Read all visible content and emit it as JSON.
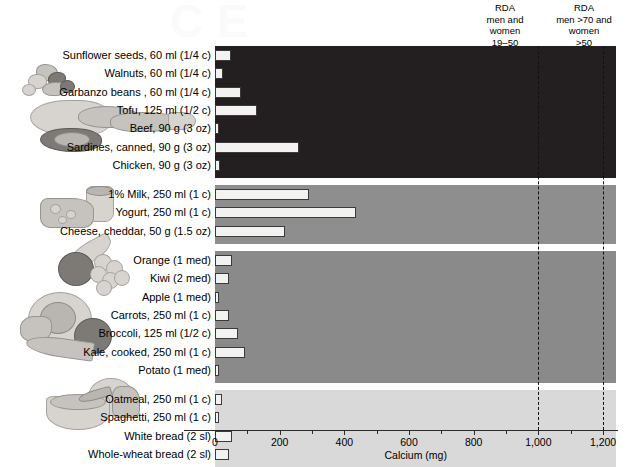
{
  "watermark_text": "CE",
  "axis": {
    "x_title": "Calcium (mg)",
    "ticks": [
      0,
      200,
      400,
      600,
      800,
      1000,
      1200
    ],
    "tick_labels": [
      "0",
      "200",
      "400",
      "600",
      "800",
      "1,000",
      "1,200"
    ],
    "xmin": 0,
    "xmax": 1240
  },
  "rda_lines": [
    {
      "name": "rda-19-50",
      "value": 1000,
      "label": "RDA\nmen and\nwomen\n19–50"
    },
    {
      "name": "rda-over-70",
      "value": 1200,
      "label": "RDA\nmen >70 and\nwomen\n>50"
    }
  ],
  "colors": {
    "band_protein": "#231f20",
    "band_dairy": "#8e8e8e",
    "band_produce": "#8a8a8a",
    "band_grains": "#d9d9d9",
    "bar_fill": "#f2f2f0",
    "bar_stroke": "#3a3a3a",
    "axis": "#2b2b2b"
  },
  "chart_data": {
    "type": "bar",
    "orientation": "horizontal",
    "title": "",
    "xlabel": "Calcium (mg)",
    "ylabel": "",
    "xlim": [
      0,
      1240
    ],
    "grid": false,
    "legend": "none",
    "annotations": [
      {
        "type": "vline",
        "value": 1000,
        "label": "RDA men and women 19–50"
      },
      {
        "type": "vline",
        "value": 1200,
        "label": "RDA men >70 and women >50"
      }
    ],
    "groups": [
      {
        "name": "protein-foods",
        "background": "#231f20",
        "illustration": "meat-fish-nuts-illustration",
        "categories": [
          "Sunflower seeds, 60 ml (1/4 c)",
          "Walnuts, 60 ml (1/4 c)",
          "Garbanzo beans , 60 ml (1/4 c)",
          "Tofu, 125 ml (1/2 c)",
          "Beef, 90 g (3 oz)",
          "Sardines, canned, 90 g (3 oz)",
          "Chicken, 90 g (3 oz)"
        ],
        "values": [
          50,
          25,
          80,
          130,
          10,
          260,
          15
        ]
      },
      {
        "name": "dairy-foods",
        "background": "#8e8e8e",
        "illustration": "cheese-milk-illustration",
        "categories": [
          "1% Milk, 250 ml (1 c)",
          "Yogurt, 250 ml (1 c)",
          "Cheese, cheddar, 50 g (1.5 oz)"
        ],
        "values": [
          290,
          435,
          215
        ]
      },
      {
        "name": "fruits-and-vegetables",
        "background": "#8a8a8a",
        "illustration": "fruit-vegetable-illustration",
        "categories": [
          "Orange (1 med)",
          "Kiwi (2 med)",
          "Apple (1 med)",
          "Carrots, 250 ml (1 c)",
          "Broccoli, 125 ml (1/2 c)",
          "Kale, cooked, 250 ml (1 c)",
          "Potato (1 med)"
        ],
        "values": [
          52,
          42,
          8,
          42,
          72,
          92,
          10
        ]
      },
      {
        "name": "grain-products",
        "background": "#d9d9d9",
        "illustration": "bread-oatmeal-illustration",
        "categories": [
          "Oatmeal, 250 ml (1 c)",
          "Spaghetti, 250 ml (1 c)",
          "White bread (2 sl)",
          "Whole-wheat bread (2 sl)"
        ],
        "values": [
          22,
          12,
          52,
          42
        ]
      }
    ]
  }
}
